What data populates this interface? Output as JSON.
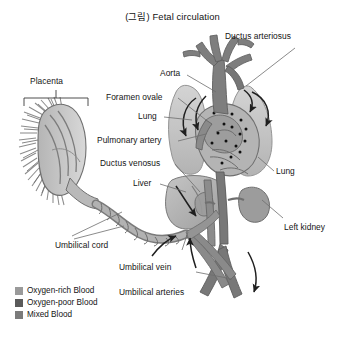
{
  "title": "(그림) Fetal circulation",
  "labels": {
    "placenta": "Placenta",
    "ductus_arteriosus": "Ductus arteriosus",
    "aorta": "Aorta",
    "foramen_ovale": "Foramen ovale",
    "lung_left": "Lung",
    "pulmonary_artery": "Pulmonary artery",
    "ductus_venosus": "Ductus venosus",
    "liver": "Liver",
    "lung_right": "Lung",
    "left_kidney": "Left kidney",
    "umbilical_cord": "Umbilical cord",
    "umbilical_vein": "Umbilical vein",
    "umbilical_arteries": "Umbilical arteries"
  },
  "legend": {
    "items": [
      {
        "label": "Oxygen-rich Blood",
        "color": "#9a9a9a"
      },
      {
        "label": "Oxygen-poor Blood",
        "color": "#5a5a5a"
      },
      {
        "label": "Mixed Blood",
        "color": "#7b7b7b"
      }
    ]
  },
  "colors": {
    "background": "#ffffff",
    "text": "#141414",
    "leader_line": "#6d6d6d",
    "organ_light": "#c9c9c9",
    "organ_mid": "#a6a6a6",
    "vessel_dark": "#6f6f6f",
    "vessel_mid": "#8a8a8a",
    "arrow": "#1f1f1f",
    "marker_dot": "#101010"
  }
}
